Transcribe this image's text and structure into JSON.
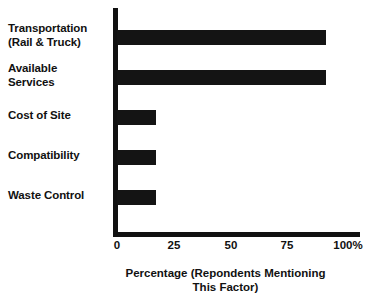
{
  "chart_data": {
    "type": "bar",
    "orientation": "horizontal",
    "title": "",
    "xlabel": "Percentage (Repondents Mentioning\nThis Factor)",
    "ylabel": "",
    "categories": [
      "Transportation\n(Rail & Truck)",
      "Available\nServices",
      "Cost of Site",
      "Compatibility",
      "Waste Control"
    ],
    "values": [
      92,
      92,
      17,
      17,
      17
    ],
    "xlim": [
      0,
      100
    ],
    "xticks": [
      0,
      25,
      50,
      75,
      100
    ],
    "xtick_labels": [
      "0",
      "25",
      "50",
      "75",
      "100%"
    ],
    "grid": false,
    "legend": false,
    "bar_color": "#141414",
    "background_color": "#ffffff",
    "axis_color": "#111111"
  },
  "bars": [
    {
      "label": "Transportation\n(Rail & Truck)",
      "value": 92,
      "top": 30,
      "label_top": 22
    },
    {
      "label": "Available\nServices",
      "value": 92,
      "top": 70,
      "label_top": 62
    },
    {
      "label": "Cost of Site",
      "value": 17,
      "top": 110,
      "label_top": 109
    },
    {
      "label": "Compatibility",
      "value": 17,
      "top": 150,
      "label_top": 149
    },
    {
      "label": "Waste Control",
      "value": 17,
      "top": 190,
      "label_top": 189
    }
  ],
  "ticks": [
    {
      "label": "0",
      "x": 117
    },
    {
      "label": "25",
      "x": 174
    },
    {
      "label": "50",
      "x": 231
    },
    {
      "label": "75",
      "x": 287
    },
    {
      "label": "100%",
      "x": 348
    }
  ],
  "axis_title": "Percentage (Repondents Mentioning\nThis Factor)"
}
